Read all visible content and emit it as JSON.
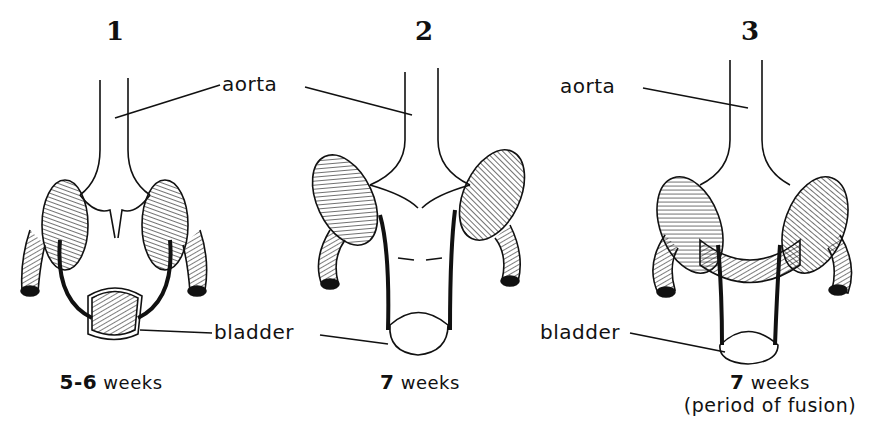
{
  "figure": {
    "panels": [
      {
        "number": "1",
        "aorta_label": "aorta",
        "bladder_label": "bladder",
        "caption_bold": "5-6",
        "caption_rest": "weeks",
        "caption_line2": ""
      },
      {
        "number": "2",
        "aorta_label": "",
        "bladder_label": "",
        "caption_bold": "7",
        "caption_rest": "weeks",
        "caption_line2": ""
      },
      {
        "number": "3",
        "aorta_label": "aorta",
        "bladder_label": "bladder",
        "caption_bold": "7",
        "caption_rest": "weeks",
        "caption_line2": "(period of fusion)"
      }
    ]
  }
}
